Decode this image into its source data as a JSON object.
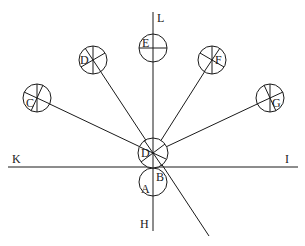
{
  "diagram": {
    "axis_labels": {
      "top": "L",
      "bottom": "H",
      "left": "K",
      "right": "I"
    },
    "center": {
      "upper_circle_label": "D",
      "lower_circle_label": "A",
      "intersection_label": "B"
    },
    "outer_circles": [
      {
        "label": "C",
        "position": "far-left"
      },
      {
        "label": "D",
        "position": "upper-left"
      },
      {
        "label": "E",
        "position": "top"
      },
      {
        "label": "F",
        "position": "upper-right"
      },
      {
        "label": "G",
        "position": "far-right"
      }
    ],
    "colors": {
      "stroke": "#1a1a1a",
      "background": "#ffffff"
    }
  }
}
